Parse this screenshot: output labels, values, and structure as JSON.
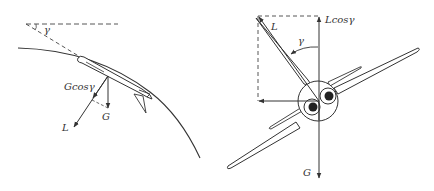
{
  "diagram": {
    "left_panel": {
      "description": "Side view of aircraft on curved path",
      "labels": {
        "gamma": "γ",
        "gcos": "Gcosγ",
        "g": "G",
        "l": "L"
      }
    },
    "right_panel": {
      "description": "Front view of banked aircraft",
      "labels": {
        "l": "L",
        "lcos": "Lcosγ",
        "gamma": "γ",
        "g": "G"
      }
    },
    "colors": {
      "ink": "#333333",
      "background": "#ffffff"
    }
  }
}
